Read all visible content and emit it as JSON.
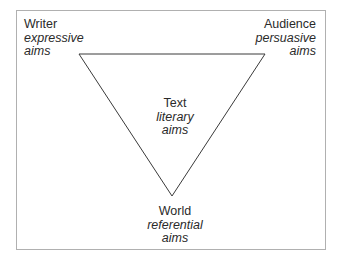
{
  "diagram": {
    "nodes": {
      "writer": {
        "name": "Writer",
        "aim_line1": "expressive",
        "aim_line2": "aims"
      },
      "audience": {
        "name": "Audience",
        "aim_line1": "persuasive",
        "aim_line2": "aims"
      },
      "text": {
        "name": "Text",
        "aim_line1": "literary",
        "aim_line2": "aims"
      },
      "world": {
        "name": "World",
        "aim_line1": "referential",
        "aim_line2": "aims"
      }
    },
    "colors": {
      "stroke": "#3a3a3a",
      "frame": "#b0b0b0",
      "text": "#2a2a2a"
    }
  }
}
